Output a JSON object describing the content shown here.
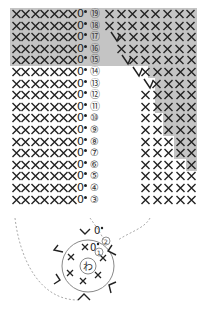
{
  "diagram": {
    "type": "crochet-chart",
    "colors": {
      "shade": "#c4c4c4",
      "stitch": "#222222",
      "dashed": "#aaaaaa"
    },
    "symbols": {
      "single_crochet": "×",
      "chain": "0",
      "slip_stitch": "•",
      "increase": "V",
      "decrease": "Λ",
      "magic_ring": "わ"
    },
    "left_block": {
      "rows": [
        {
          "label": "⑲",
          "stitches": "××××××× 0•",
          "shaded": true
        },
        {
          "label": "⑱",
          "stitches": "××××××× 0•",
          "shaded": true
        },
        {
          "label": "⑰",
          "stitches": "××××××× 0•",
          "shaded": true
        },
        {
          "label": "⑯",
          "stitches": "××××××× 0•",
          "shaded": true
        },
        {
          "label": "⑮",
          "stitches": "××××××× 0•",
          "shaded": true
        },
        {
          "label": "⑭",
          "stitches": "××××××× 0•",
          "shaded": false
        },
        {
          "label": "⑬",
          "stitches": "××××××× 0•",
          "shaded": false
        },
        {
          "label": "⑫",
          "stitches": "××××××× 0•",
          "shaded": false
        },
        {
          "label": "⑪",
          "stitches": "××××××× 0•",
          "shaded": false
        },
        {
          "label": "⑩",
          "stitches": "××××××× 0•",
          "shaded": false
        },
        {
          "label": "⑨",
          "stitches": "××××××× 0•",
          "shaded": false
        },
        {
          "label": "⑧",
          "stitches": "××××××× 0•",
          "shaded": false
        },
        {
          "label": "⑦",
          "stitches": "××××××× 0•",
          "shaded": false
        },
        {
          "label": "⑥",
          "stitches": "××××××× 0•",
          "shaded": false
        },
        {
          "label": "⑤",
          "stitches": "××××××× 0•",
          "shaded": false
        },
        {
          "label": "④",
          "stitches": "××××××× 0•",
          "shaded": false
        },
        {
          "label": "③",
          "stitches": "××××××× 0•",
          "shaded": false
        }
      ]
    },
    "right_block": {
      "rows": [
        {
          "row": "⑲",
          "decrease": false,
          "x_count": 8,
          "x_start": 104,
          "shade_from": 100
        },
        {
          "row": "⑱",
          "decrease": false,
          "x_count": 8,
          "x_start": 104,
          "shade_from": 100
        },
        {
          "row": "⑰",
          "decrease": true,
          "dec_x": 110,
          "x_count": 7,
          "x_start": 116,
          "shade_from": 100
        },
        {
          "row": "⑯",
          "decrease": false,
          "x_count": 7,
          "x_start": 116,
          "shade_from": 100
        },
        {
          "row": "⑮",
          "decrease": true,
          "dec_x": 121,
          "x_count": 6,
          "x_start": 128,
          "shade_from": 100
        },
        {
          "row": "⑭",
          "decrease": true,
          "dec_x": 132,
          "x_count": 5,
          "x_start": 140,
          "shade_from": 148
        },
        {
          "row": "⑬",
          "decrease": true,
          "dec_x": 143,
          "x_count": 4,
          "x_start": 151,
          "shade_from": 155
        },
        {
          "row": "⑫",
          "decrease": false,
          "x_count": 5,
          "x_start": 140,
          "shade_from": 155
        },
        {
          "row": "⑪",
          "decrease": false,
          "x_count": 5,
          "x_start": 140,
          "shade_from": 155
        },
        {
          "row": "⑩",
          "decrease": false,
          "x_count": 5,
          "x_start": 140,
          "shade_from": 163
        },
        {
          "row": "⑨",
          "decrease": false,
          "x_count": 5,
          "x_start": 140,
          "shade_from": 163
        },
        {
          "row": "⑧",
          "decrease": false,
          "x_count": 5,
          "x_start": 140,
          "shade_from": 174
        },
        {
          "row": "⑦",
          "decrease": false,
          "x_count": 5,
          "x_start": 140,
          "shade_from": 174
        },
        {
          "row": "⑥",
          "decrease": false,
          "x_count": 5,
          "x_start": 140,
          "shade_from": 186
        },
        {
          "row": "⑤",
          "decrease": false,
          "x_count": 5,
          "x_start": 140,
          "shade_from": null
        },
        {
          "row": "④",
          "decrease": false,
          "x_count": 5,
          "x_start": 140,
          "shade_from": null
        },
        {
          "row": "③",
          "decrease": false,
          "x_count": 5,
          "x_start": 140,
          "shade_from": null
        }
      ]
    },
    "ring": {
      "center_label": "わ",
      "round_labels": [
        "①",
        "②"
      ],
      "round1_text": "×0•",
      "round2_text": "0•"
    }
  }
}
